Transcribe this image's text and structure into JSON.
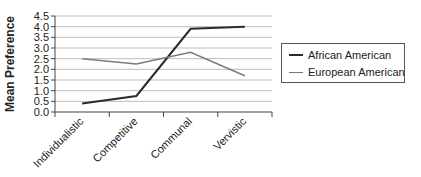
{
  "chart_data": {
    "type": "line",
    "title": "",
    "xlabel": "",
    "ylabel": "Mean Preference",
    "categories": [
      "Individualistic",
      "Competitive",
      "Communal",
      "Vervistic"
    ],
    "ylim": [
      0.0,
      4.5
    ],
    "yticks": [
      "0.0",
      "0.5",
      "1.0",
      "1.5",
      "2.0",
      "2.5",
      "3.0",
      "3.5",
      "4.0",
      "4.5"
    ],
    "grid": true,
    "legend_position": "right",
    "series": [
      {
        "name": "African American",
        "values": [
          0.4,
          0.75,
          3.9,
          4.0
        ],
        "color": "#2b2b2b",
        "width": 2
      },
      {
        "name": "European American",
        "values": [
          2.5,
          2.25,
          2.8,
          1.7
        ],
        "color": "#7a7a7a",
        "width": 1.5
      }
    ]
  },
  "legend": {
    "items": [
      {
        "label": "African American",
        "color": "#2b2b2b"
      },
      {
        "label": "European American",
        "color": "#7a7a7a"
      }
    ]
  }
}
